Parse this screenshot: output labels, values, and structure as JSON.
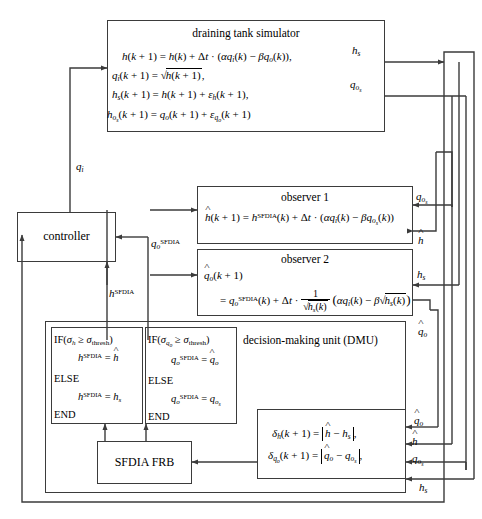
{
  "diagram": {
    "name": "SFDIA draining tank control block diagram",
    "width": 482,
    "height": 519,
    "line_color": "#3b3b3b"
  },
  "blocks": {
    "simulator": {
      "title": "draining tank simulator",
      "equations": [
        "h(k + 1) = h(k) + Δt · (αq_i(k) − βq_o(k)),",
        "q_i(k + 1) = √h(k + 1),",
        "h_s(k + 1) = h(k + 1) + ε_h(k + 1),",
        "h_o_s(k + 1) = q_o(k + 1) + ε_q_o(k + 1)"
      ]
    },
    "observer1": {
      "title": "observer 1",
      "equation": "ĥ(k + 1) = h^SFDIA(k) + Δt · (αq_i(k) − βq_o_s(k))"
    },
    "observer2": {
      "title": "observer 2",
      "equation_line1": "q̂_o(k + 1)",
      "equation_line2": "= q_o^SFDIA(k) + Δt · 1/√(h_s(k)) (αq_i(k) − β√(h_s(k)))"
    },
    "dmu": {
      "title": "decision-making unit (DMU)",
      "rule_h": {
        "if": "IF(σ_h ≥ σ_thresh)",
        "then": "h^SFDIA = ĥ",
        "else_kw": "ELSE",
        "else_body": "h^SFDIA = h_s",
        "end": "END"
      },
      "rule_q": {
        "if": "IF(σ_q_o ≥ σ_thresh)",
        "then": "q_o^SFDIA = q̂_o",
        "else_kw": "ELSE",
        "else_body": "q_o^SFDIA = q_o_s",
        "end": "END"
      },
      "residuals": [
        "δ_h(k + 1) = |ĥ − h_s|,",
        "δ_q_o(k + 1) = |q̂_o − q_o_s|,"
      ],
      "frb_label": "SFDIA FRB"
    },
    "controller": {
      "label": "controller"
    }
  },
  "signals": {
    "q_i": "q_i",
    "h_s_top": "h_s",
    "q_os_top": "q_o_s",
    "q_os_right": "q_o_s",
    "h_hat_right": "ĥ",
    "h_s_right": "h_s",
    "q_hat_o_right": "q̂_o",
    "q_hat_o_fb": "q̂_o",
    "h_hat_fb": "ĥ",
    "q_os_fb": "q_o_s",
    "h_s_fb": "h_s",
    "q_o_sfdia": "q_o^SFDIA",
    "h_sfdia": "h^SFDIA"
  }
}
